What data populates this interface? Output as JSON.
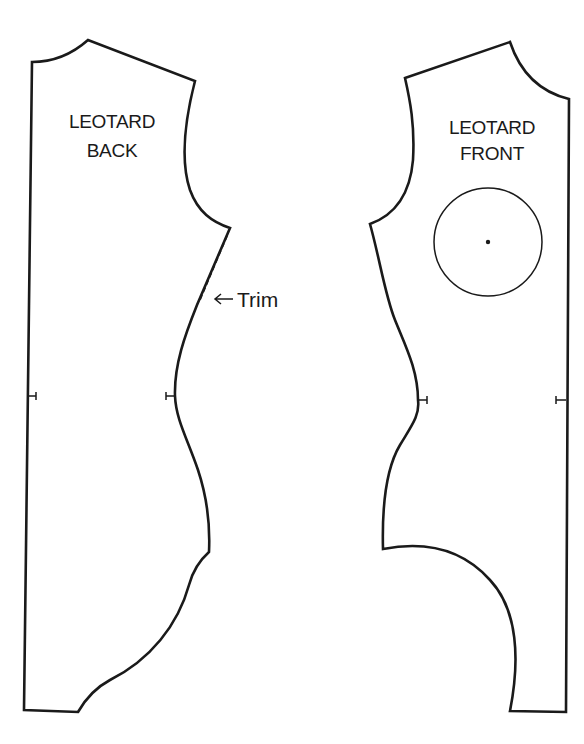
{
  "diagram": {
    "type": "sewing-pattern",
    "pieces": [
      {
        "id": "back",
        "label_line1": "LEOTARD",
        "label_line2": "BACK",
        "notches": 2,
        "annotation": {
          "text": "Trim",
          "arrow": "left-arrow",
          "refers_to": "dashed trim line at side seam below armhole"
        }
      },
      {
        "id": "front",
        "label_line1": "LEOTARD",
        "label_line2": "FRONT",
        "notches": 2,
        "marking": "circle with center dot"
      }
    ],
    "colors": {
      "line": "#1a1a1a",
      "background": "#ffffff"
    }
  }
}
